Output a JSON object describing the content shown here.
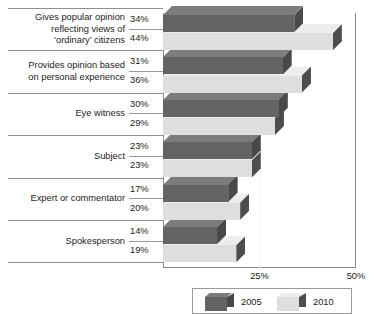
{
  "chart_data": {
    "type": "bar",
    "orientation": "horizontal",
    "title": "",
    "xlabel": "",
    "ylabel": "",
    "xlim": [
      0,
      50
    ],
    "xticks": [
      25,
      50
    ],
    "xticklabels": [
      "25%",
      "50%"
    ],
    "grid": "dashed vertical gridline at 25%",
    "legend_position": "bottom",
    "categories": [
      "Gives popular opinion reflecting views of 'ordinary' citizens",
      "Provides opinion based on personal experience",
      "Eye witness",
      "Subject",
      "Expert or commentator",
      "Spokesperson"
    ],
    "series": [
      {
        "name": "2005",
        "values": [
          34,
          31,
          30,
          23,
          17,
          14
        ]
      },
      {
        "name": "2010",
        "values": [
          44,
          36,
          29,
          23,
          20,
          19
        ]
      }
    ]
  },
  "rows": [
    {
      "label_lines": [
        "Gives popular opinion",
        "reflecting views of",
        "‘ordinary’ citizens"
      ],
      "v2005": "34%",
      "v2010": "44%"
    },
    {
      "label_lines": [
        "Provides opinion based",
        "on personal experience"
      ],
      "v2005": "31%",
      "v2010": "36%"
    },
    {
      "label_lines": [
        "Eye witness"
      ],
      "v2005": "30%",
      "v2010": "29%"
    },
    {
      "label_lines": [
        "Subject"
      ],
      "v2005": "23%",
      "v2010": "23%"
    },
    {
      "label_lines": [
        "Expert or commentator"
      ],
      "v2005": "17%",
      "v2010": "20%"
    },
    {
      "label_lines": [
        "Spokesperson"
      ],
      "v2005": "14%",
      "v2010": "19%"
    }
  ],
  "axis": {
    "tick_25": "25%",
    "tick_50": "50%"
  },
  "legend": {
    "items": [
      {
        "label": "2005",
        "color": "#646464"
      },
      {
        "label": "2010",
        "color": "#dedede"
      }
    ]
  },
  "colors": {
    "series_2005": "#646464",
    "series_2010": "#dedede",
    "series_2005_top": "#7c7c7c",
    "series_2005_side": "#494949",
    "series_2010_top": "#ededed",
    "series_2010_side": "#4d4d4d",
    "frame": "#8a8a8a",
    "separator": "#8f8f8f",
    "text": "#1c1c1c",
    "gridline": "#f2f2f2"
  }
}
